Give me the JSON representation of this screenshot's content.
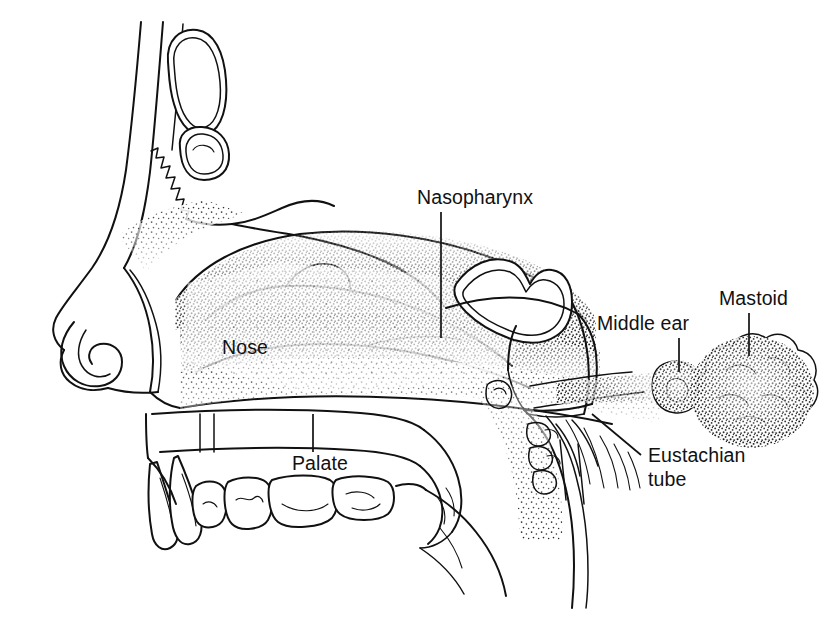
{
  "figure": {
    "style": "black-and-white stippled line drawing",
    "background_color": "#ffffff",
    "ink_color": "#111111",
    "width": 823,
    "height": 626
  },
  "labels": [
    {
      "id": "nasopharynx",
      "text": "Nasopharynx",
      "text_x": 417,
      "text_y": 204,
      "anchor": "start",
      "leader": "M 441 212 L 441 338"
    },
    {
      "id": "mastoid",
      "text": "Mastoid",
      "text_x": 719,
      "text_y": 305,
      "anchor": "start",
      "leader": "M 749 313 L 749 356"
    },
    {
      "id": "middle-ear",
      "text": "Middle ear",
      "text_x": 597,
      "text_y": 330,
      "anchor": "start",
      "leader": "M 679 338 L 679 372"
    },
    {
      "id": "nose",
      "text": "Nose",
      "text_x": 222,
      "text_y": 354,
      "anchor": "start",
      "leader": ""
    },
    {
      "id": "palate",
      "text": "Palate",
      "text_x": 292,
      "text_y": 470,
      "anchor": "start",
      "leader": "M 313 414 L 313 452"
    },
    {
      "id": "eustachian-tube",
      "text_lines": [
        "Eustachian",
        "tube"
      ],
      "text": "Eustachian tube",
      "text_x": 648,
      "text_y": 462,
      "line_height": 24,
      "anchor": "start",
      "leader": "M 641 455 L 592 414"
    }
  ],
  "structures": [
    {
      "id": "frontal-sinus-upper",
      "name": "upper frontal sinus cavity"
    },
    {
      "id": "frontal-sinus-lower",
      "name": "lower frontal sinus cavity"
    },
    {
      "id": "forehead-contour",
      "name": "forehead and nasal bridge contour"
    },
    {
      "id": "nasal-tip",
      "name": "nose tip and nostril"
    },
    {
      "id": "turbinates",
      "name": "nasal turbinates with stipple shading"
    },
    {
      "id": "sphenoid-sinus",
      "name": "sphenoid sinus"
    },
    {
      "id": "nasopharynx-cavity",
      "name": "nasopharyngeal airway"
    },
    {
      "id": "hard-palate",
      "name": "hard palate"
    },
    {
      "id": "soft-palate-uvula",
      "name": "soft palate and uvula"
    },
    {
      "id": "teeth-row",
      "name": "upper teeth"
    },
    {
      "id": "tongue",
      "name": "tongue"
    },
    {
      "id": "eustachian-channel",
      "name": "eustachian tube channel"
    },
    {
      "id": "middle-ear-cavity",
      "name": "middle ear cavity"
    },
    {
      "id": "mastoid-air-cells",
      "name": "mastoid air cells cluster"
    },
    {
      "id": "pharyngeal-wall",
      "name": "posterior pharyngeal wall"
    },
    {
      "id": "adenoid-tissue",
      "name": "adenoid / tubal tonsil tissue"
    }
  ]
}
